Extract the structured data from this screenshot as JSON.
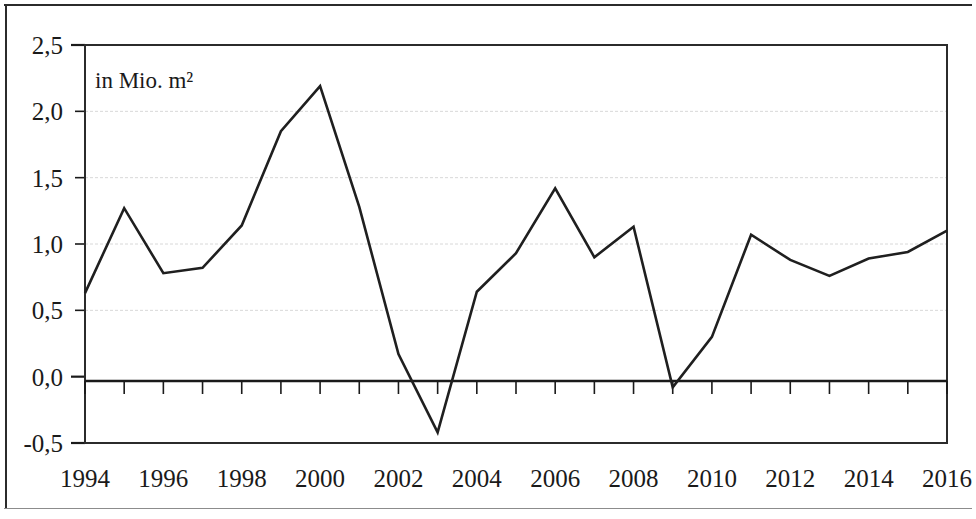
{
  "figure": {
    "unit_note": "in Mio. m²",
    "background": "#ffffff",
    "line_color": "#1f1f1f",
    "grid_color": "#d8d8d8",
    "axis_color": "#1a1a1a"
  },
  "chart_data": {
    "type": "line",
    "title": "",
    "subtitle": "",
    "annotation": "in Mio. m²",
    "xlabel": "",
    "ylabel": "",
    "ylim": [
      -0.5,
      2.5
    ],
    "ytick_values": [
      2.5,
      2.0,
      1.5,
      1.0,
      0.5,
      0.0,
      -0.5
    ],
    "ytick_labels": [
      "2,5",
      "2,0",
      "1,5",
      "1,0",
      "0,5",
      "0,0",
      "-0,5"
    ],
    "xlim": [
      1994,
      2016
    ],
    "xtick_labels": [
      "1994",
      "1996",
      "1998",
      "2000",
      "2002",
      "2004",
      "2006",
      "2008",
      "2010",
      "2012",
      "2014",
      "2016"
    ],
    "xtick_values": [
      1994,
      1996,
      1998,
      2000,
      2002,
      2004,
      2006,
      2008,
      2010,
      2012,
      2014,
      2016
    ],
    "minor_ticks_every": 1,
    "grid": "horizontal",
    "legend": null,
    "x": [
      1994,
      1995,
      1996,
      1997,
      1998,
      1999,
      2000,
      2001,
      2002,
      2003,
      2004,
      2005,
      2006,
      2007,
      2008,
      2009,
      2010,
      2011,
      2012,
      2013,
      2014,
      2015,
      2016
    ],
    "values": [
      0.63,
      1.27,
      0.78,
      0.82,
      1.14,
      1.85,
      2.19,
      1.28,
      0.17,
      -0.42,
      0.64,
      0.93,
      1.42,
      0.9,
      1.13,
      -0.08,
      0.3,
      1.07,
      0.88,
      0.76,
      0.89,
      0.94,
      1.1
    ],
    "series": [
      {
        "name": "Baugenehmigungen",
        "values": [
          0.63,
          1.27,
          0.78,
          0.82,
          1.14,
          1.85,
          2.19,
          1.28,
          0.17,
          -0.42,
          0.64,
          0.93,
          1.42,
          0.9,
          1.13,
          -0.08,
          0.3,
          1.07,
          0.88,
          0.76,
          0.89,
          0.94,
          1.1
        ]
      }
    ]
  }
}
